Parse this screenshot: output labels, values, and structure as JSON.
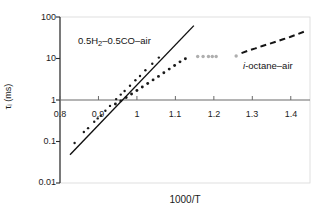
{
  "chart_data": {
    "type": "scatter",
    "title": "",
    "xlabel": "1000/T",
    "ylabel": "τᵢ (ms)",
    "yscale": "log",
    "xscale": "linear",
    "xlim": [
      0.8,
      1.45
    ],
    "ylim": [
      0.01,
      100
    ],
    "grid": false,
    "legend": "inline-annotations",
    "x_ticks": [
      "0.8",
      "0.9",
      "1",
      "1.1",
      "1.2",
      "1.3",
      "1.4"
    ],
    "x_tick_values": [
      0.8,
      0.9,
      1.0,
      1.1,
      1.2,
      1.3,
      1.4
    ],
    "y_ticks": [
      "100",
      "10",
      "1",
      "0.1",
      "0.01"
    ],
    "y_tick_values": [
      100,
      10,
      1,
      0.1,
      0.01
    ],
    "annotations": [
      {
        "name": "syngas-label",
        "text_plain": "0.5H2–0.5CO–air",
        "prefix": "0.5H",
        "subscript": "2",
        "suffix": "–0.5CO–air",
        "x": 0.93,
        "y": 23
      },
      {
        "name": "octane-label",
        "text_plain": "i-octane–air",
        "italic_prefix": "i",
        "suffix": "-octane–air",
        "x": 1.3,
        "y": 6.5
      }
    ],
    "series": [
      {
        "name": "0.5H2-0.5CO-air fit line",
        "style": "solid-line",
        "color": "#101010",
        "x": [
          0.826,
          1.148
        ],
        "y": [
          0.048,
          62.0
        ]
      },
      {
        "name": "0.5H2-0.5CO-air data points",
        "style": "small-dots",
        "color": "#1a1a1a",
        "x": [
          0.838,
          0.862,
          0.873,
          0.889,
          0.898,
          0.906,
          0.918,
          0.93,
          0.946,
          0.958,
          0.968,
          0.982,
          0.996,
          1.008,
          1.022,
          1.04,
          1.057
        ],
        "y": [
          0.092,
          0.17,
          0.21,
          0.3,
          0.36,
          0.42,
          0.55,
          0.72,
          1.05,
          1.35,
          1.65,
          2.2,
          3.0,
          3.8,
          5.2,
          7.5,
          10.5
        ]
      },
      {
        "name": "intermediate dotted series",
        "style": "dotted-line",
        "color": "#1a1a1a",
        "x": [
          0.944,
          0.958,
          0.972,
          0.986,
          1.0,
          1.014,
          1.028,
          1.042,
          1.056,
          1.07,
          1.084,
          1.098,
          1.112,
          1.126
        ],
        "y": [
          0.8,
          0.95,
          1.15,
          1.4,
          1.7,
          2.05,
          2.5,
          3.05,
          3.7,
          4.55,
          5.55,
          6.8,
          8.3,
          9.9
        ]
      },
      {
        "name": "faint scattered markers",
        "style": "faint-dots",
        "color": "#9a9a9a",
        "x": [
          1.158,
          1.172,
          1.186,
          1.196,
          1.206,
          1.258
        ],
        "y": [
          11.2,
          11.2,
          11.2,
          11.2,
          11.2,
          11.5
        ]
      },
      {
        "name": "i-octane-air dashed curve",
        "style": "dashed-line",
        "color": "#141414",
        "x": [
          1.272,
          1.29,
          1.308,
          1.326,
          1.344,
          1.362,
          1.38,
          1.398,
          1.416,
          1.434
        ],
        "y": [
          13.5,
          15.5,
          17.5,
          20.0,
          22.5,
          25.5,
          29.0,
          33.0,
          38.0,
          44.0
        ]
      }
    ]
  }
}
